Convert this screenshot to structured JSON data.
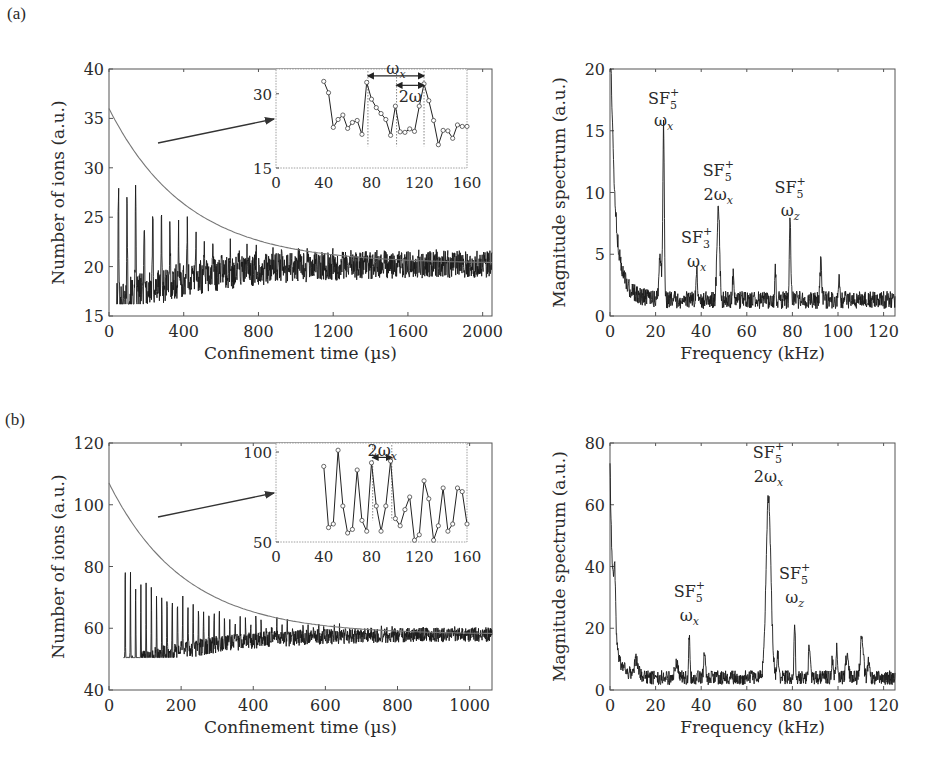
{
  "figure": {
    "panel_labels": [
      "(a)",
      "(b)"
    ]
  },
  "chart_data": [
    {
      "id": "a-time",
      "panel": "(a)",
      "type": "line",
      "xlabel": "Confinement time (µs)",
      "ylabel": "Number of ions (a.u.)",
      "xlim": [
        0,
        2050
      ],
      "ylim": [
        15,
        40
      ],
      "xticks": [
        0,
        400,
        800,
        1200,
        1600,
        2000
      ],
      "yticks": [
        15,
        20,
        25,
        30,
        35,
        40
      ],
      "grid": false,
      "box": {
        "x0": 109,
        "y0": 69,
        "x1": 492,
        "y1": 316
      },
      "series": [
        {
          "name": "measured ion signal",
          "kind": "noisy-oscillation",
          "t_start": 40,
          "t_end": 2050,
          "baseline": 20.3,
          "envelope_amp": 15.5,
          "tau": 420,
          "osc_period": 46,
          "noise": 1.3,
          "min": 16.2,
          "max": 35.4
        },
        {
          "name": "exponential fit",
          "kind": "exp-fit",
          "y0": 36.0,
          "y_inf": 20.3,
          "tau": 420
        }
      ],
      "inset": {
        "box": {
          "x0": 276,
          "y0": 69,
          "x1": 467,
          "y1": 168
        },
        "xlim": [
          0,
          160
        ],
        "ylim": [
          15,
          35
        ],
        "xticks": [
          0,
          40,
          80,
          120,
          160
        ],
        "yticks": [
          15,
          30
        ],
        "points_x": [
          40,
          44,
          48,
          52,
          56,
          60,
          64,
          68,
          72,
          76,
          80,
          84,
          88,
          92,
          96,
          100,
          104,
          108,
          112,
          116,
          120,
          124,
          128,
          132,
          136,
          140,
          144,
          148,
          152,
          156,
          160
        ],
        "points_y": [
          32.5,
          30.2,
          23.2,
          24.8,
          25.7,
          23.0,
          24.2,
          24.6,
          21.8,
          32.3,
          28.9,
          27.2,
          26.0,
          24.8,
          21.6,
          27.5,
          22.3,
          22.2,
          22.9,
          22.4,
          27.5,
          32.0,
          28.6,
          24.6,
          19.7,
          22.6,
          22.5,
          21.0,
          23.7,
          23.4,
          23.4
        ],
        "annotations": [
          {
            "text": "ωx",
            "from_x": 77,
            "to_x": 124,
            "y": 33.6,
            "label_y": 35.2
          },
          {
            "text": "2ω",
            "from_x": 101,
            "to_x": 124,
            "y": 31.7,
            "label_y": 29.6
          }
        ],
        "dotted_markers_x": [
          77,
          101,
          124
        ]
      },
      "arrow": {
        "from": [
          158,
          143
        ],
        "to": [
          276,
          119
        ]
      }
    },
    {
      "id": "a-spectrum",
      "panel": "(a)",
      "type": "line",
      "xlabel": "Frequency (kHz)",
      "ylabel": "Magnitude spectrum (a.u.)",
      "xlim": [
        0,
        125
      ],
      "ylim": [
        0,
        20
      ],
      "xticks": [
        0,
        20,
        40,
        60,
        80,
        100,
        120
      ],
      "yticks": [
        0,
        5,
        10,
        15,
        20
      ],
      "grid": false,
      "box": {
        "x0": 610,
        "y0": 69,
        "x1": 895,
        "y1": 316
      },
      "series": [
        {
          "name": "FFT magnitude",
          "kind": "spectrum",
          "floor": 1.3,
          "noise": 0.8,
          "dc": 20.0,
          "dc_width": 1.6,
          "peaks": [
            {
              "f": 23.5,
              "h": 14.3,
              "w": 0.45
            },
            {
              "f": 22.0,
              "h": 3.2,
              "w": 0.8
            },
            {
              "f": 38.0,
              "h": 2.4,
              "w": 0.4
            },
            {
              "f": 47.5,
              "h": 7.7,
              "w": 0.8
            },
            {
              "f": 54.0,
              "h": 2.0,
              "w": 0.4
            },
            {
              "f": 72.5,
              "h": 2.6,
              "w": 0.35
            },
            {
              "f": 79.0,
              "h": 6.6,
              "w": 0.45
            },
            {
              "f": 92.5,
              "h": 3.3,
              "w": 0.5
            },
            {
              "f": 100.5,
              "h": 2.2,
              "w": 0.4
            }
          ]
        }
      ],
      "peak_labels": [
        {
          "ion": "SF",
          "sub": "5",
          "sup": "+",
          "mode": "ω",
          "mode_prefix": "",
          "mode_sub": "x",
          "f": 23.5,
          "y_ion": 17.2,
          "y_mode": 15.4
        },
        {
          "ion": "SF",
          "sub": "3",
          "sup": "+",
          "mode": "ω",
          "mode_prefix": "",
          "mode_sub": "x",
          "f": 38.0,
          "y_ion": 5.9,
          "y_mode": 4.0
        },
        {
          "ion": "SF",
          "sub": "5",
          "sup": "+",
          "mode": "ω",
          "mode_prefix": "2",
          "mode_sub": "x",
          "f": 47.5,
          "y_ion": 11.3,
          "y_mode": 9.4
        },
        {
          "ion": "SF",
          "sub": "5",
          "sup": "+",
          "mode": "ω",
          "mode_prefix": "",
          "mode_sub": "z",
          "f": 79.0,
          "y_ion": 10.0,
          "y_mode": 8.1
        }
      ]
    },
    {
      "id": "b-time",
      "panel": "(b)",
      "type": "line",
      "xlabel": "Confinement time (µs)",
      "ylabel": "Number of ions (a.u.)",
      "xlim": [
        0,
        1062
      ],
      "ylim": [
        40,
        120
      ],
      "xticks": [
        0,
        200,
        400,
        600,
        800,
        1000
      ],
      "yticks": [
        40,
        60,
        80,
        100,
        120
      ],
      "grid": false,
      "box": {
        "x0": 109,
        "y0": 443,
        "x1": 492,
        "y1": 690
      },
      "series": [
        {
          "name": "measured ion signal",
          "kind": "noisy-oscillation",
          "t_start": 40,
          "t_end": 1062,
          "baseline": 58.0,
          "envelope_amp": 48.0,
          "tau": 210,
          "osc_period": 14.5,
          "noise": 2.2,
          "min": 50.5,
          "max": 101.5
        },
        {
          "name": "exponential fit",
          "kind": "exp-fit",
          "y0": 107.0,
          "y_inf": 58.0,
          "tau": 210
        }
      ],
      "inset": {
        "box": {
          "x0": 276,
          "y0": 443,
          "x1": 467,
          "y1": 542
        },
        "xlim": [
          0,
          160
        ],
        "ylim": [
          50,
          105
        ],
        "xticks": [
          0,
          40,
          80,
          120,
          160
        ],
        "yticks": [
          50,
          100
        ],
        "points_x": [
          40,
          44,
          48,
          52,
          56,
          60,
          64,
          68,
          72,
          76,
          80,
          84,
          88,
          92,
          96,
          100,
          104,
          108,
          112,
          116,
          120,
          124,
          128,
          132,
          136,
          140,
          144,
          148,
          152,
          156,
          160
        ],
        "points_y": [
          92,
          58,
          60,
          101,
          70,
          55,
          57,
          90,
          62,
          56,
          94,
          70,
          56,
          70,
          95,
          63,
          59,
          68,
          75,
          51,
          54,
          84,
          74,
          51,
          59,
          80,
          56,
          60,
          80,
          78,
          60
        ],
        "annotations": [
          {
            "text": "2ωx",
            "from_x": 81,
            "to_x": 97,
            "y": 97,
            "label_y": 101
          }
        ],
        "dotted_markers_x": [
          81,
          97
        ]
      },
      "arrow": {
        "from": [
          158,
          517
        ],
        "to": [
          276,
          493
        ]
      }
    },
    {
      "id": "b-spectrum",
      "panel": "(b)",
      "type": "line",
      "xlabel": "Frequency (kHz)",
      "ylabel": "Magnitude spectrum (a.u.)",
      "xlim": [
        0,
        125
      ],
      "ylim": [
        0,
        80
      ],
      "xticks": [
        0,
        20,
        40,
        60,
        80,
        100,
        120
      ],
      "yticks": [
        0,
        20,
        40,
        60,
        80
      ],
      "grid": false,
      "box": {
        "x0": 610,
        "y0": 443,
        "x1": 895,
        "y1": 690
      },
      "series": [
        {
          "name": "FFT magnitude",
          "kind": "spectrum",
          "floor": 4.0,
          "noise": 2.6,
          "dc": 56.0,
          "dc_width": 1.2,
          "peaks": [
            {
              "f": 2.0,
              "h": 18.0,
              "w": 0.6
            },
            {
              "f": 11.5,
              "h": 5.0,
              "w": 1.2
            },
            {
              "f": 29.0,
              "h": 5.0,
              "w": 1.0
            },
            {
              "f": 34.8,
              "h": 14.5,
              "w": 0.4
            },
            {
              "f": 41.5,
              "h": 7.5,
              "w": 0.6
            },
            {
              "f": 69.5,
              "h": 58.5,
              "w": 1.5
            },
            {
              "f": 73.5,
              "h": 8.5,
              "w": 0.5
            },
            {
              "f": 81.0,
              "h": 18.5,
              "w": 0.4
            },
            {
              "f": 87.5,
              "h": 11.0,
              "w": 0.55
            },
            {
              "f": 97.5,
              "h": 7.0,
              "w": 0.4
            },
            {
              "f": 99.5,
              "h": 9.5,
              "w": 0.55
            },
            {
              "f": 104.0,
              "h": 7.5,
              "w": 0.8
            },
            {
              "f": 110.5,
              "h": 13.5,
              "w": 0.9
            },
            {
              "f": 113.5,
              "h": 5.0,
              "w": 0.6
            }
          ]
        }
      ],
      "peak_labels": [
        {
          "ion": "SF",
          "sub": "5",
          "sup": "+",
          "mode": "ω",
          "mode_prefix": "",
          "mode_sub": "x",
          "f": 34.8,
          "y_ion": 30.0,
          "y_mode": 22.4
        },
        {
          "ion": "SF",
          "sub": "5",
          "sup": "+",
          "mode": "ω",
          "mode_prefix": "2",
          "mode_sub": "x",
          "f": 69.5,
          "y_ion": 75.3,
          "y_mode": 67.5
        },
        {
          "ion": "SF",
          "sub": "5",
          "sup": "+",
          "mode": "ω",
          "mode_prefix": "",
          "mode_sub": "z",
          "f": 81.0,
          "y_ion": 36.0,
          "y_mode": 28.3
        }
      ]
    }
  ]
}
